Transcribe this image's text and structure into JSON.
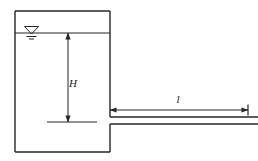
{
  "diagram": {
    "type": "hydraulics-schematic",
    "stroke_color": "#262626",
    "background_color": "#ffffff",
    "labels": {
      "head": "H",
      "length": "l"
    },
    "icons": {
      "water_surface": "water-surface-symbol",
      "head_dimension": "vertical-dimension-arrow",
      "length_dimension": "horizontal-dimension-arrow"
    },
    "geometry": {
      "tank": {
        "left": 15,
        "top": 11,
        "right": 110,
        "bottom": 152
      },
      "water_line_y": 33,
      "pipe": {
        "top_y": 117,
        "bottom_y": 124,
        "start_x": 110,
        "end_x": 258
      },
      "head_dimension": {
        "x": 68,
        "top_y": 33,
        "bottom_y": 122
      },
      "datum_line": {
        "x1": 47,
        "x2": 97,
        "y": 122
      },
      "length_dimension": {
        "y": 110,
        "x1": 110,
        "x2": 248
      }
    }
  }
}
